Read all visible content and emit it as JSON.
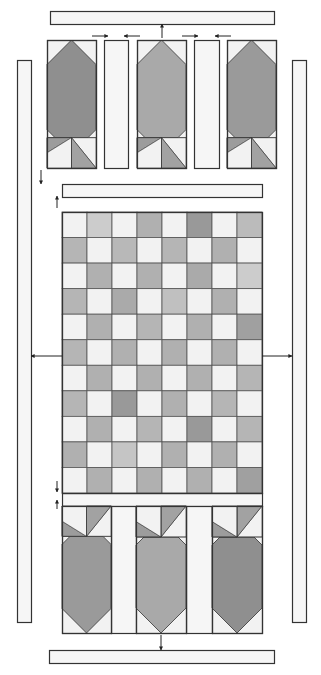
{
  "diagram": {
    "type": "quilt-assembly-diagram",
    "colors": {
      "outline": "#333333",
      "light": "#f2f2f2",
      "strip": "#f6f6f6",
      "arrow": "#222222",
      "block_dark": "#8f8f8f",
      "block_mid": "#a9a9a9",
      "block_med": "#9a9a9a",
      "tri_a": "#9c9c9c",
      "tri_b": "#a2a2a2"
    },
    "top_border": {
      "x": 50,
      "y": 11,
      "w": 224,
      "h": 13
    },
    "bottom_border": {
      "x": 49,
      "y": 650,
      "w": 225,
      "h": 13
    },
    "left_border": {
      "x": 17,
      "y": 60,
      "w": 14,
      "h": 562
    },
    "right_border": {
      "x": 292,
      "y": 60,
      "w": 14,
      "h": 562
    },
    "top_row": {
      "y": 40,
      "h": 128,
      "blocks": [
        {
          "x": 47,
          "w": 49,
          "fill": "#8f8f8f"
        },
        {
          "x": 137,
          "w": 49,
          "fill": "#a9a9a9"
        },
        {
          "x": 227,
          "w": 49,
          "fill": "#9a9a9a"
        }
      ],
      "sashes": [
        {
          "x": 104,
          "w": 24
        },
        {
          "x": 194,
          "w": 25
        }
      ]
    },
    "top_sash": {
      "x": 62,
      "y": 184,
      "w": 200,
      "h": 13
    },
    "checkerboard": {
      "x": 62,
      "y": 212,
      "w": 200,
      "h": 281,
      "rows": 11,
      "cols": 8,
      "cells": [
        [
          "#f2f2f2",
          "#cccccc",
          "#f2f2f2",
          "#b0b0b0",
          "#f2f2f2",
          "#999999",
          "#f2f2f2",
          "#bbbbbb"
        ],
        [
          "#b5b5b5",
          "#f2f2f2",
          "#b8b8b8",
          "#f2f2f2",
          "#b5b5b5",
          "#f2f2f2",
          "#b0b0b0",
          "#f2f2f2"
        ],
        [
          "#f2f2f2",
          "#b0b0b0",
          "#f2f2f2",
          "#b0b0b0",
          "#f2f2f2",
          "#aaaaaa",
          "#f2f2f2",
          "#cccccc"
        ],
        [
          "#b5b5b5",
          "#f2f2f2",
          "#aaaaaa",
          "#f2f2f2",
          "#c0c0c0",
          "#f2f2f2",
          "#b0b0b0",
          "#f2f2f2"
        ],
        [
          "#f2f2f2",
          "#b0b0b0",
          "#f2f2f2",
          "#b5b5b5",
          "#f2f2f2",
          "#b0b0b0",
          "#f2f2f2",
          "#a0a0a0"
        ],
        [
          "#b5b5b5",
          "#f2f2f2",
          "#b0b0b0",
          "#f2f2f2",
          "#b0b0b0",
          "#f2f2f2",
          "#b0b0b0",
          "#f2f2f2"
        ],
        [
          "#f2f2f2",
          "#b0b0b0",
          "#f2f2f2",
          "#b0b0b0",
          "#f2f2f2",
          "#b0b0b0",
          "#f2f2f2",
          "#b5b5b5"
        ],
        [
          "#b5b5b5",
          "#f2f2f2",
          "#999999",
          "#f2f2f2",
          "#b0b0b0",
          "#f2f2f2",
          "#b5b5b5",
          "#f2f2f2"
        ],
        [
          "#f2f2f2",
          "#b0b0b0",
          "#f2f2f2",
          "#b5b5b5",
          "#f2f2f2",
          "#999999",
          "#f2f2f2",
          "#b5b5b5"
        ],
        [
          "#b0b0b0",
          "#f2f2f2",
          "#c5c5c5",
          "#f2f2f2",
          "#b0b0b0",
          "#f2f2f2",
          "#b0b0b0",
          "#f2f2f2"
        ],
        [
          "#f2f2f2",
          "#b0b0b0",
          "#f2f2f2",
          "#b0b0b0",
          "#f2f2f2",
          "#b0b0b0",
          "#f2f2f2",
          "#a0a0a0"
        ]
      ]
    },
    "bottom_sash": {
      "x": 62,
      "y": 493,
      "w": 200,
      "h": 13
    },
    "bottom_row": {
      "y": 506,
      "h": 127,
      "blocks": [
        {
          "x": 62,
          "w": 49,
          "fill": "#9a9a9a"
        },
        {
          "x": 136,
          "w": 50,
          "fill": "#a9a9a9"
        },
        {
          "x": 212,
          "w": 50,
          "fill": "#8f8f8f"
        }
      ],
      "sashes": [
        {
          "x": 111,
          "w": 25
        },
        {
          "x": 186,
          "w": 26
        }
      ]
    },
    "arrows": [
      {
        "name": "arrow-top-center-up",
        "x1": 162,
        "y1": 38,
        "x2": 162,
        "y2": 24
      },
      {
        "name": "arrow-top-sash1-right",
        "x1": 92,
        "y1": 36,
        "x2": 108,
        "y2": 36
      },
      {
        "name": "arrow-top-sash1-left",
        "x1": 140,
        "y1": 36,
        "x2": 124,
        "y2": 36
      },
      {
        "name": "arrow-top-sash2-right",
        "x1": 182,
        "y1": 36,
        "x2": 198,
        "y2": 36
      },
      {
        "name": "arrow-top-sash2-left",
        "x1": 231,
        "y1": 36,
        "x2": 215,
        "y2": 36
      },
      {
        "name": "arrow-topblocks-down",
        "x1": 41,
        "y1": 170,
        "x2": 41,
        "y2": 184
      },
      {
        "name": "arrow-sash-up",
        "x1": 57,
        "y1": 208,
        "x2": 57,
        "y2": 196
      },
      {
        "name": "arrow-left-border",
        "x1": 62,
        "y1": 356,
        "x2": 31,
        "y2": 356
      },
      {
        "name": "arrow-right-border",
        "x1": 262,
        "y1": 356,
        "x2": 292,
        "y2": 356
      },
      {
        "name": "arrow-grid-down",
        "x1": 57,
        "y1": 481,
        "x2": 57,
        "y2": 492
      },
      {
        "name": "arrow-bottomsash-up",
        "x1": 57,
        "y1": 509,
        "x2": 57,
        "y2": 500
      },
      {
        "name": "arrow-bottom-center-down",
        "x1": 161,
        "y1": 635,
        "x2": 161,
        "y2": 650
      }
    ]
  }
}
